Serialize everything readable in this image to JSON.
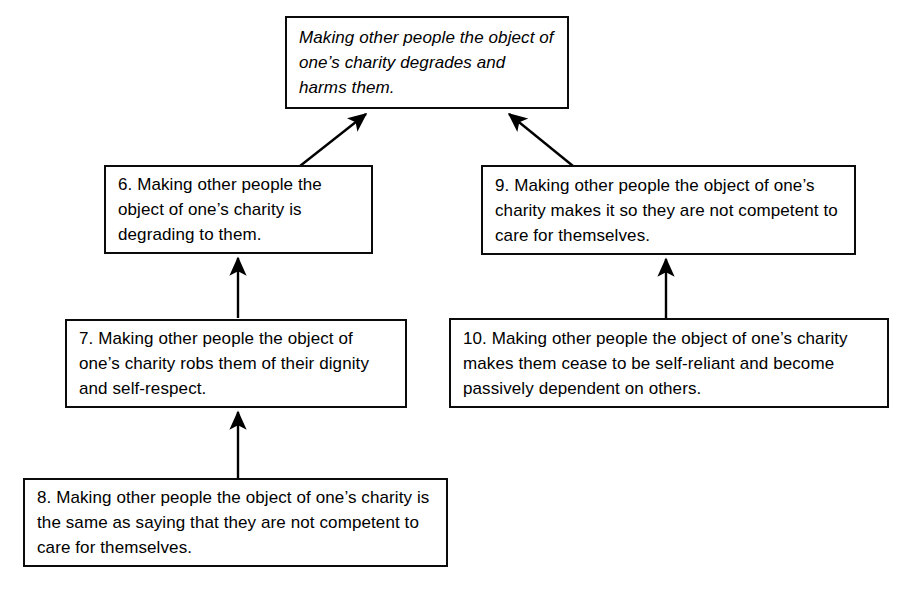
{
  "diagram": {
    "type": "argument-map",
    "canvas": {
      "width": 911,
      "height": 593
    },
    "style": {
      "background_color": "#ffffff",
      "box_border_color": "#0b0b0b",
      "text_color": "#000000",
      "arrow_color": "#000000"
    },
    "nodes": [
      {
        "id": "conclusion",
        "number": "",
        "role": "conclusion",
        "emphasis": "italic",
        "text": "Making other people the object of one’s charity degrades and harms them.",
        "lines": [
          "Making other people the",
          "object of one’s charity",
          "degrades and harms them."
        ]
      },
      {
        "id": "6",
        "number": "6.",
        "role": "premise",
        "emphasis": "normal",
        "text": "6. Making other people the object of one’s charity is degrading to them.",
        "lines": [
          "6. Making other people",
          "the object of one’s charity",
          "is degrading to them."
        ]
      },
      {
        "id": "9",
        "number": "9.",
        "role": "premise",
        "emphasis": "normal",
        "text": "9. Making other people the object of one’s charity makes it so they are not competent to care for themselves.",
        "lines": [
          "9. Making other people the object of",
          "one’s charity makes it so they are not",
          "competent to care for themselves."
        ]
      },
      {
        "id": "7",
        "number": "7.",
        "role": "premise",
        "emphasis": "normal",
        "text": "7. Making other people the object of one’s charity robs them of their dignity and self-respect.",
        "lines": [
          "7. Making other people the object",
          "of one’s charity robs them of their",
          "dignity and self-respect."
        ]
      },
      {
        "id": "10",
        "number": "10.",
        "role": "premise",
        "emphasis": "normal",
        "text": "10. Making other people the object of one’s charity makes them cease to be self-reliant and become passively dependent on others.",
        "lines": [
          "10. Making other people the object of one’s",
          "charity makes them cease to be self-reliant",
          "and become passively dependent on others."
        ]
      },
      {
        "id": "8",
        "number": "8.",
        "role": "premise",
        "emphasis": "normal",
        "text": "8. Making other people the object of one’s charity is the same as saying that they are not competent to care for themselves.",
        "lines": [
          "8. Making other people the object of one’s",
          "charity is the same as saying that they are",
          "not competent to care for themselves."
        ]
      }
    ],
    "edges": [
      {
        "id": "edge-6-to-conclusion",
        "from": "6",
        "to": "conclusion",
        "shape": "diagonal"
      },
      {
        "id": "edge-9-to-conclusion",
        "from": "9",
        "to": "conclusion",
        "shape": "diagonal"
      },
      {
        "id": "edge-7-to-6",
        "from": "7",
        "to": "6",
        "shape": "vertical"
      },
      {
        "id": "edge-10-to-9",
        "from": "10",
        "to": "9",
        "shape": "vertical"
      },
      {
        "id": "edge-8-to-7",
        "from": "8",
        "to": "7",
        "shape": "vertical"
      }
    ]
  }
}
